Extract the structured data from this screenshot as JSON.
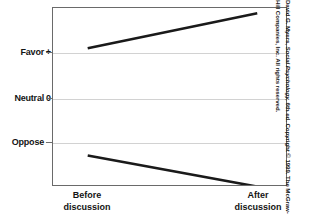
{
  "figure": {
    "name": "group-polarization-line-graph",
    "credit": {
      "author": "David G. Myers,",
      "work_title": "Social Psychology,",
      "rest": "6th ed. Copyright © 1999. The McGraw-Hill Companies, Inc. All rights reserved."
    },
    "colors": {
      "line": "#1a1a1a",
      "grid": "#d2d2d2",
      "frame": "#6a6a6a",
      "text": "#141414",
      "background": "#ffffff"
    }
  },
  "chart_data": {
    "type": "line",
    "title": "",
    "subtitle": "",
    "xlabel": "",
    "ylabel": "",
    "x": [
      "Before discussion",
      "After discussion"
    ],
    "x_tick_labels": [
      {
        "line1": "Before",
        "line2": "discussion"
      },
      {
        "line1": "After",
        "line2": "discussion"
      }
    ],
    "y_tick_labels": [
      {
        "label": "Favor",
        "sign": "+",
        "value": 1
      },
      {
        "label": "Neutral",
        "sign": "0",
        "value": 0
      },
      {
        "label": "Oppose",
        "sign": "–",
        "value": -1
      }
    ],
    "ylim": [
      -1.55,
      1.75
    ],
    "xlim": [
      0,
      1
    ],
    "grid": true,
    "grid_axis": "y",
    "legend": "none",
    "series": [
      {
        "name": "Initially favoring group",
        "values": [
          1.0,
          1.65
        ],
        "points": [
          {
            "x": "Before discussion",
            "y": 1.0
          },
          {
            "x": "After discussion",
            "y": 1.65
          }
        ]
      },
      {
        "name": "Initially opposing group",
        "values": [
          -1.0,
          -1.58
        ],
        "points": [
          {
            "x": "Before discussion",
            "y": -1.0
          },
          {
            "x": "After discussion",
            "y": -1.58
          }
        ]
      }
    ],
    "annotations": []
  }
}
